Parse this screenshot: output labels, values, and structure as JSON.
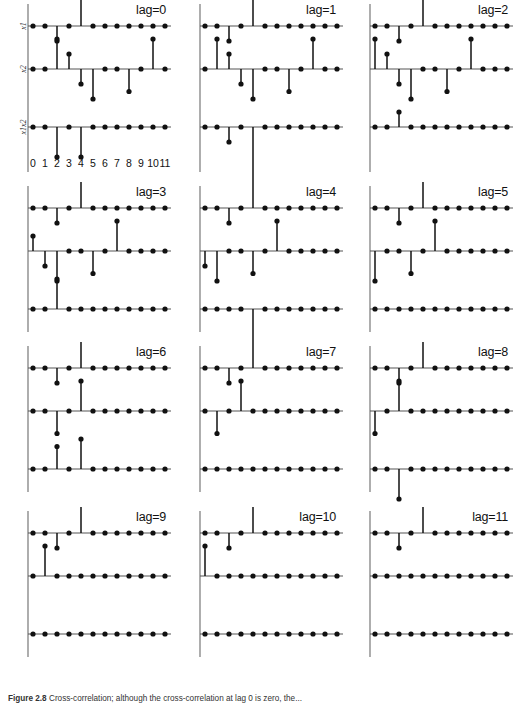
{
  "figure": {
    "caption_label": "Figure 2.8",
    "caption_text": "Cross-correlation; although the cross-correlation at lag 0 is zero, the..."
  },
  "axes": {
    "series_labels": [
      "x1",
      "x2",
      "x1x2"
    ],
    "tick_labels": [
      "0",
      "1",
      "2",
      "3",
      "4",
      "5",
      "6",
      "7",
      "8",
      "9",
      "10",
      "11"
    ],
    "xlim": [
      0,
      11
    ],
    "ylim": [
      -2.6,
      2.6
    ],
    "grid": false,
    "baseline_color": "#555555",
    "stem_color": "#111111",
    "marker_color": "#111111"
  },
  "chart_data": {
    "type": "scatter",
    "title": "",
    "xlabel": "",
    "ylabel": "",
    "x": [
      0,
      1,
      2,
      3,
      4,
      5,
      6,
      7,
      8,
      9,
      10,
      11
    ],
    "base_series": {
      "x1": [
        0,
        0,
        -1,
        0,
        2,
        0,
        0,
        0,
        0,
        0,
        0,
        0
      ],
      "x2": [
        0,
        0,
        2,
        1,
        -1,
        -2,
        0,
        0,
        -1.5,
        0,
        2,
        0
      ]
    },
    "panels": [
      {
        "lag_label": "lag=0",
        "lag": 0,
        "series": [
          {
            "name": "x1",
            "values": [
              0,
              0,
              -1,
              0,
              2,
              0,
              0,
              0,
              0,
              0,
              0,
              0
            ]
          },
          {
            "name": "x2",
            "values": [
              0,
              0,
              2,
              1,
              -1,
              -2,
              0,
              0,
              -1.5,
              0,
              2,
              0
            ]
          },
          {
            "name": "x1x2",
            "values": [
              0,
              0,
              -2,
              0,
              -2,
              0,
              0,
              0,
              0,
              0,
              0,
              0
            ]
          }
        ]
      },
      {
        "lag_label": "lag=1",
        "lag": 1,
        "series": [
          {
            "name": "x1",
            "values": [
              0,
              0,
              -1,
              0,
              2,
              0,
              0,
              0,
              0,
              0,
              0,
              0
            ]
          },
          {
            "name": "x2",
            "values": [
              0,
              2,
              1,
              -1,
              -2,
              0,
              0,
              -1.5,
              0,
              2,
              0,
              0
            ]
          },
          {
            "name": "x1x2",
            "values": [
              0,
              0,
              -1,
              0,
              -4,
              0,
              0,
              0,
              0,
              0,
              0,
              0
            ]
          }
        ]
      },
      {
        "lag_label": "lag=2",
        "lag": 2,
        "series": [
          {
            "name": "x1",
            "values": [
              0,
              0,
              -1,
              0,
              2,
              0,
              0,
              0,
              0,
              0,
              0,
              0
            ]
          },
          {
            "name": "x2",
            "values": [
              2,
              1,
              -1,
              -2,
              0,
              0,
              -1.5,
              0,
              2,
              0,
              0,
              0
            ]
          },
          {
            "name": "x1x2",
            "values": [
              0,
              0,
              1,
              0,
              0,
              0,
              0,
              0,
              0,
              0,
              0,
              0
            ]
          }
        ]
      },
      {
        "lag_label": "lag=3",
        "lag": 3,
        "series": [
          {
            "name": "x1",
            "values": [
              0,
              0,
              -1,
              0,
              2,
              0,
              0,
              0,
              0,
              0,
              0,
              0
            ]
          },
          {
            "name": "x2",
            "values": [
              1,
              -1,
              -2,
              0,
              0,
              -1.5,
              0,
              2,
              0,
              0,
              0,
              0
            ]
          },
          {
            "name": "x1x2",
            "values": [
              0,
              0,
              2,
              0,
              0,
              0,
              0,
              0,
              0,
              0,
              0,
              0
            ]
          }
        ]
      },
      {
        "lag_label": "lag=4",
        "lag": 4,
        "series": [
          {
            "name": "x1",
            "values": [
              0,
              0,
              -1,
              0,
              2,
              0,
              0,
              0,
              0,
              0,
              0,
              0
            ]
          },
          {
            "name": "x2",
            "values": [
              -1,
              -2,
              0,
              0,
              -1.5,
              0,
              2,
              0,
              0,
              0,
              0,
              0
            ]
          },
          {
            "name": "x1x2",
            "values": [
              0,
              0,
              0,
              0,
              -3,
              0,
              0,
              0,
              0,
              0,
              0,
              0
            ]
          }
        ]
      },
      {
        "lag_label": "lag=5",
        "lag": 5,
        "series": [
          {
            "name": "x1",
            "values": [
              0,
              0,
              -1,
              0,
              2,
              0,
              0,
              0,
              0,
              0,
              0,
              0
            ]
          },
          {
            "name": "x2",
            "values": [
              -2,
              0,
              0,
              -1.5,
              0,
              2,
              0,
              0,
              0,
              0,
              0,
              0
            ]
          },
          {
            "name": "x1x2",
            "values": [
              0,
              0,
              0,
              0,
              0,
              0,
              0,
              0,
              0,
              0,
              0,
              0
            ]
          }
        ]
      },
      {
        "lag_label": "lag=6",
        "lag": 6,
        "series": [
          {
            "name": "x1",
            "values": [
              0,
              0,
              -1,
              0,
              2,
              0,
              0,
              0,
              0,
              0,
              0,
              0
            ]
          },
          {
            "name": "x2",
            "values": [
              0,
              0,
              -1.5,
              0,
              2,
              0,
              0,
              0,
              0,
              0,
              0,
              0
            ]
          },
          {
            "name": "x1x2",
            "values": [
              0,
              0,
              1.5,
              0,
              2,
              0,
              0,
              0,
              0,
              0,
              0,
              0
            ]
          }
        ]
      },
      {
        "lag_label": "lag=7",
        "lag": 7,
        "series": [
          {
            "name": "x1",
            "values": [
              0,
              0,
              -1,
              0,
              2,
              0,
              0,
              0,
              0,
              0,
              0,
              0
            ]
          },
          {
            "name": "x2",
            "values": [
              0,
              -1.5,
              0,
              2,
              0,
              0,
              0,
              0,
              0,
              0,
              0,
              0
            ]
          },
          {
            "name": "x1x2",
            "values": [
              0,
              0,
              0,
              0,
              0,
              0,
              0,
              0,
              0,
              0,
              0,
              0
            ]
          }
        ]
      },
      {
        "lag_label": "lag=8",
        "lag": 8,
        "series": [
          {
            "name": "x1",
            "values": [
              0,
              0,
              -1,
              0,
              2,
              0,
              0,
              0,
              0,
              0,
              0,
              0
            ]
          },
          {
            "name": "x2",
            "values": [
              -1.5,
              0,
              2,
              0,
              0,
              0,
              0,
              0,
              0,
              0,
              0,
              0
            ]
          },
          {
            "name": "x1x2",
            "values": [
              0,
              0,
              -2,
              0,
              0,
              0,
              0,
              0,
              0,
              0,
              0,
              0
            ]
          }
        ]
      },
      {
        "lag_label": "lag=9",
        "lag": 9,
        "series": [
          {
            "name": "x1",
            "values": [
              0,
              0,
              -1,
              0,
              2,
              0,
              0,
              0,
              0,
              0,
              0,
              0
            ]
          },
          {
            "name": "x2",
            "values": [
              0,
              2,
              0,
              0,
              0,
              0,
              0,
              0,
              0,
              0,
              0,
              0
            ]
          },
          {
            "name": "x1x2",
            "values": [
              0,
              0,
              0,
              0,
              0,
              0,
              0,
              0,
              0,
              0,
              0,
              0
            ]
          }
        ]
      },
      {
        "lag_label": "lag=10",
        "lag": 10,
        "series": [
          {
            "name": "x1",
            "values": [
              0,
              0,
              -1,
              0,
              2,
              0,
              0,
              0,
              0,
              0,
              0,
              0
            ]
          },
          {
            "name": "x2",
            "values": [
              2,
              0,
              0,
              0,
              0,
              0,
              0,
              0,
              0,
              0,
              0,
              0
            ]
          },
          {
            "name": "x1x2",
            "values": [
              0,
              0,
              0,
              0,
              0,
              0,
              0,
              0,
              0,
              0,
              0,
              0
            ]
          }
        ]
      },
      {
        "lag_label": "lag=11",
        "lag": 11,
        "series": [
          {
            "name": "x1",
            "values": [
              0,
              0,
              -1,
              0,
              2,
              0,
              0,
              0,
              0,
              0,
              0,
              0
            ]
          },
          {
            "name": "x2",
            "values": [
              0,
              0,
              0,
              0,
              0,
              0,
              0,
              0,
              0,
              0,
              0,
              0
            ]
          },
          {
            "name": "x1x2",
            "values": [
              0,
              0,
              0,
              0,
              0,
              0,
              0,
              0,
              0,
              0,
              0,
              0
            ]
          }
        ]
      }
    ]
  }
}
